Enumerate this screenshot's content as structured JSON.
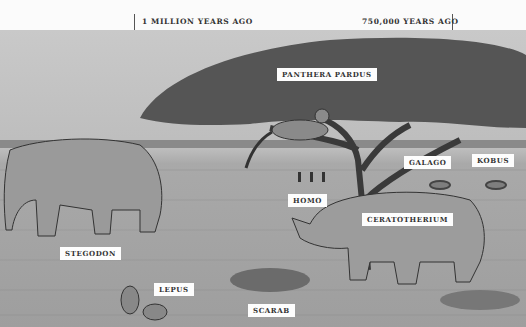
{
  "timeline": {
    "markers": [
      {
        "label": "1 MILLION YEARS AGO",
        "x": 135
      },
      {
        "label": "750,000 YEARS AGO",
        "x": 452
      }
    ]
  },
  "scene": {
    "description": "Savanna illustration with acacia tree and animals",
    "labels": [
      {
        "id": "panthera-pardus",
        "text": "PANTHERA PARDUS"
      },
      {
        "id": "galago",
        "text": "GALAGO"
      },
      {
        "id": "kobus",
        "text": "KOBUS"
      },
      {
        "id": "homo",
        "text": "HOMO"
      },
      {
        "id": "ceratotherium",
        "text": "CERATOTHERIUM"
      },
      {
        "id": "stegodon",
        "text": "STEGODON"
      },
      {
        "id": "lepus",
        "text": "LEPUS"
      },
      {
        "id": "scarab",
        "text": "SCARAB"
      }
    ]
  }
}
